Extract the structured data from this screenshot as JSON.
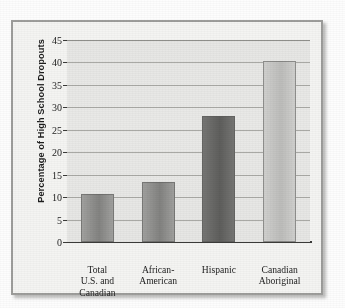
{
  "chart_data": {
    "type": "bar",
    "title": "",
    "subtitle": "",
    "xlabel": "",
    "ylabel": "Percentage of High School Dropouts",
    "categories": [
      "Total\nU.S. and\nCanadian",
      "African-\nAmerican",
      "Hispanic",
      "Canadian\nAboriginal"
    ],
    "values": [
      10.8,
      13.3,
      28.1,
      40.4
    ],
    "ylim": [
      0,
      45
    ],
    "yticks": [
      0,
      5,
      10,
      15,
      20,
      25,
      30,
      35,
      40,
      45
    ],
    "ytick_labels": [
      "0",
      "5",
      "10",
      "15",
      "20",
      "25",
      "30",
      "35",
      "40",
      "45"
    ],
    "grid": true,
    "legend": false,
    "legend_position": "none",
    "bar_colors": [
      "#8f8f8d",
      "#8e8e8c",
      "#6a6a68",
      "#c5c5c3"
    ]
  },
  "axis": {
    "y_title": "Percentage of High School Dropouts"
  },
  "colors": {
    "plot_background": "#e7e7e5",
    "frame_border": "#9d9d9b",
    "figure_background": "#f3f3f1",
    "gridline": "#a9a9a5",
    "axis_line": "#3a3a38",
    "text": "#232323"
  }
}
